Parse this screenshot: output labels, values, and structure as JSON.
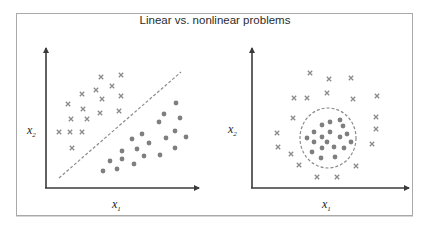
{
  "title": "Linear vs. nonlinear problems",
  "colors": {
    "axis": "#3a3a3a",
    "marker": "#8a8a8a",
    "dot": "#7f7f7f",
    "boundary": "#8c8c8c",
    "border": "#a9a9a9"
  },
  "left_plot": {
    "name": "linear",
    "xlabel": "x",
    "xlabel_sub": "1",
    "ylabel": "x",
    "ylabel_sub": "2",
    "boundary": {
      "type": "line",
      "style": "dashed",
      "from": [
        59,
        178
      ],
      "to": [
        181,
        72
      ]
    },
    "crosses": [
      [
        101,
        77
      ],
      [
        121,
        75
      ],
      [
        112,
        86
      ],
      [
        96,
        90
      ],
      [
        82,
        94
      ],
      [
        102,
        99
      ],
      [
        121,
        96
      ],
      [
        68,
        104
      ],
      [
        83,
        109
      ],
      [
        100,
        113
      ],
      [
        119,
        111
      ],
      [
        71,
        119
      ],
      [
        87,
        119
      ],
      [
        59,
        132
      ],
      [
        70,
        132
      ],
      [
        82,
        132
      ],
      [
        72,
        148
      ]
    ],
    "dots": [
      [
        176,
        103
      ],
      [
        164,
        114
      ],
      [
        180,
        118
      ],
      [
        159,
        122
      ],
      [
        175,
        131
      ],
      [
        186,
        137
      ],
      [
        142,
        134
      ],
      [
        132,
        139
      ],
      [
        166,
        138
      ],
      [
        149,
        143
      ],
      [
        137,
        149
      ],
      [
        122,
        151
      ],
      [
        175,
        148
      ],
      [
        144,
        156
      ],
      [
        160,
        155
      ],
      [
        122,
        159
      ],
      [
        110,
        161
      ],
      [
        134,
        164
      ],
      [
        117,
        169
      ],
      [
        103,
        171
      ]
    ]
  },
  "right_plot": {
    "name": "nonlinear",
    "xlabel": "x",
    "xlabel_sub": "1",
    "ylabel": "x",
    "ylabel_sub": "2",
    "boundary": {
      "type": "ellipse",
      "style": "dashed",
      "cx": 328,
      "cy": 138,
      "rx": 28,
      "ry": 30
    },
    "crosses": [
      [
        310,
        73
      ],
      [
        329,
        79
      ],
      [
        351,
        78
      ],
      [
        294,
        98
      ],
      [
        307,
        98
      ],
      [
        327,
        93
      ],
      [
        353,
        99
      ],
      [
        377,
        96
      ],
      [
        293,
        118
      ],
      [
        376,
        117
      ],
      [
        376,
        129
      ],
      [
        277,
        133
      ],
      [
        278,
        147
      ],
      [
        372,
        144
      ],
      [
        291,
        154
      ],
      [
        299,
        165
      ],
      [
        356,
        166
      ],
      [
        317,
        177
      ],
      [
        337,
        177
      ]
    ],
    "dots": [
      [
        322,
        125
      ],
      [
        330,
        122
      ],
      [
        340,
        120
      ],
      [
        343,
        126
      ],
      [
        314,
        132
      ],
      [
        330,
        132
      ],
      [
        347,
        134
      ],
      [
        340,
        137
      ],
      [
        307,
        138
      ],
      [
        322,
        137
      ],
      [
        327,
        142
      ],
      [
        351,
        142
      ],
      [
        314,
        142
      ],
      [
        334,
        147
      ],
      [
        344,
        148
      ],
      [
        322,
        148
      ],
      [
        312,
        152
      ],
      [
        321,
        158
      ],
      [
        335,
        157
      ]
    ]
  }
}
